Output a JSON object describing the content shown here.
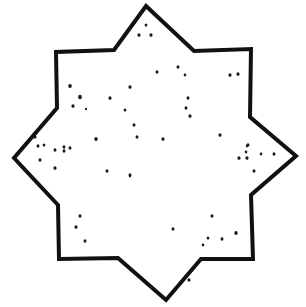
{
  "figure": {
    "background_color": "#ffffff",
    "stroke_color": "#111111",
    "dot_color": "#1a1a1a",
    "stroke_width": 4,
    "star_points": [
      [
        146,
        6
      ],
      [
        194,
        51
      ],
      [
        251,
        49
      ],
      [
        250,
        117
      ],
      [
        296,
        156
      ],
      [
        251,
        195
      ],
      [
        253,
        259
      ],
      [
        201,
        259
      ],
      [
        166,
        300
      ],
      [
        118,
        258
      ],
      [
        59,
        259
      ],
      [
        58,
        205
      ],
      [
        14,
        158
      ],
      [
        57,
        108
      ],
      [
        56,
        52
      ],
      [
        114,
        50
      ]
    ],
    "dots": [
      [
        139,
        35,
        1.6
      ],
      [
        146,
        25,
        1.4
      ],
      [
        151,
        35,
        1.6
      ],
      [
        70,
        86,
        1.8
      ],
      [
        80,
        97,
        1.9
      ],
      [
        73,
        106,
        1.6
      ],
      [
        86,
        109,
        1.1
      ],
      [
        110,
        98,
        1.6
      ],
      [
        130,
        87,
        1.6
      ],
      [
        125,
        110,
        1.4
      ],
      [
        134,
        125,
        1.5
      ],
      [
        137,
        137,
        1.5
      ],
      [
        96,
        139,
        1.7
      ],
      [
        64,
        151,
        1.5
      ],
      [
        70,
        148,
        1.5
      ],
      [
        157,
        72,
        1.5
      ],
      [
        178,
        67,
        1.5
      ],
      [
        185,
        75,
        1.3
      ],
      [
        188,
        98,
        1.5
      ],
      [
        186,
        108,
        1.5
      ],
      [
        190,
        116,
        1.6
      ],
      [
        163,
        139,
        1.6
      ],
      [
        220,
        135,
        1.6
      ],
      [
        230,
        75,
        1.6
      ],
      [
        238,
        74,
        1.6
      ],
      [
        248,
        145,
        1.5
      ],
      [
        35,
        137,
        1.5
      ],
      [
        38,
        146,
        1.5
      ],
      [
        44,
        145,
        1.4
      ],
      [
        40,
        160,
        1.5
      ],
      [
        55,
        150,
        1.5
      ],
      [
        64,
        147,
        1.5
      ],
      [
        55,
        168,
        1.6
      ],
      [
        107,
        171,
        1.5
      ],
      [
        130,
        175,
        1.5
      ],
      [
        130,
        176,
        1.2
      ],
      [
        239,
        158,
        1.6
      ],
      [
        247,
        158,
        1.6
      ],
      [
        261,
        154,
        1.3
      ],
      [
        274,
        154,
        1.5
      ],
      [
        254,
        171,
        1.5
      ],
      [
        246,
        152,
        1.3
      ],
      [
        247,
        146,
        1.2
      ],
      [
        212,
        216,
        1.5
      ],
      [
        208,
        238,
        1.4
      ],
      [
        222,
        239,
        1.5
      ],
      [
        236,
        233,
        1.7
      ],
      [
        189,
        280,
        1.5
      ],
      [
        203,
        245,
        1.3
      ],
      [
        173,
        229,
        1.5
      ],
      [
        80,
        216,
        1.5
      ],
      [
        76,
        227,
        1.6
      ],
      [
        85,
        241,
        1.5
      ]
    ]
  }
}
